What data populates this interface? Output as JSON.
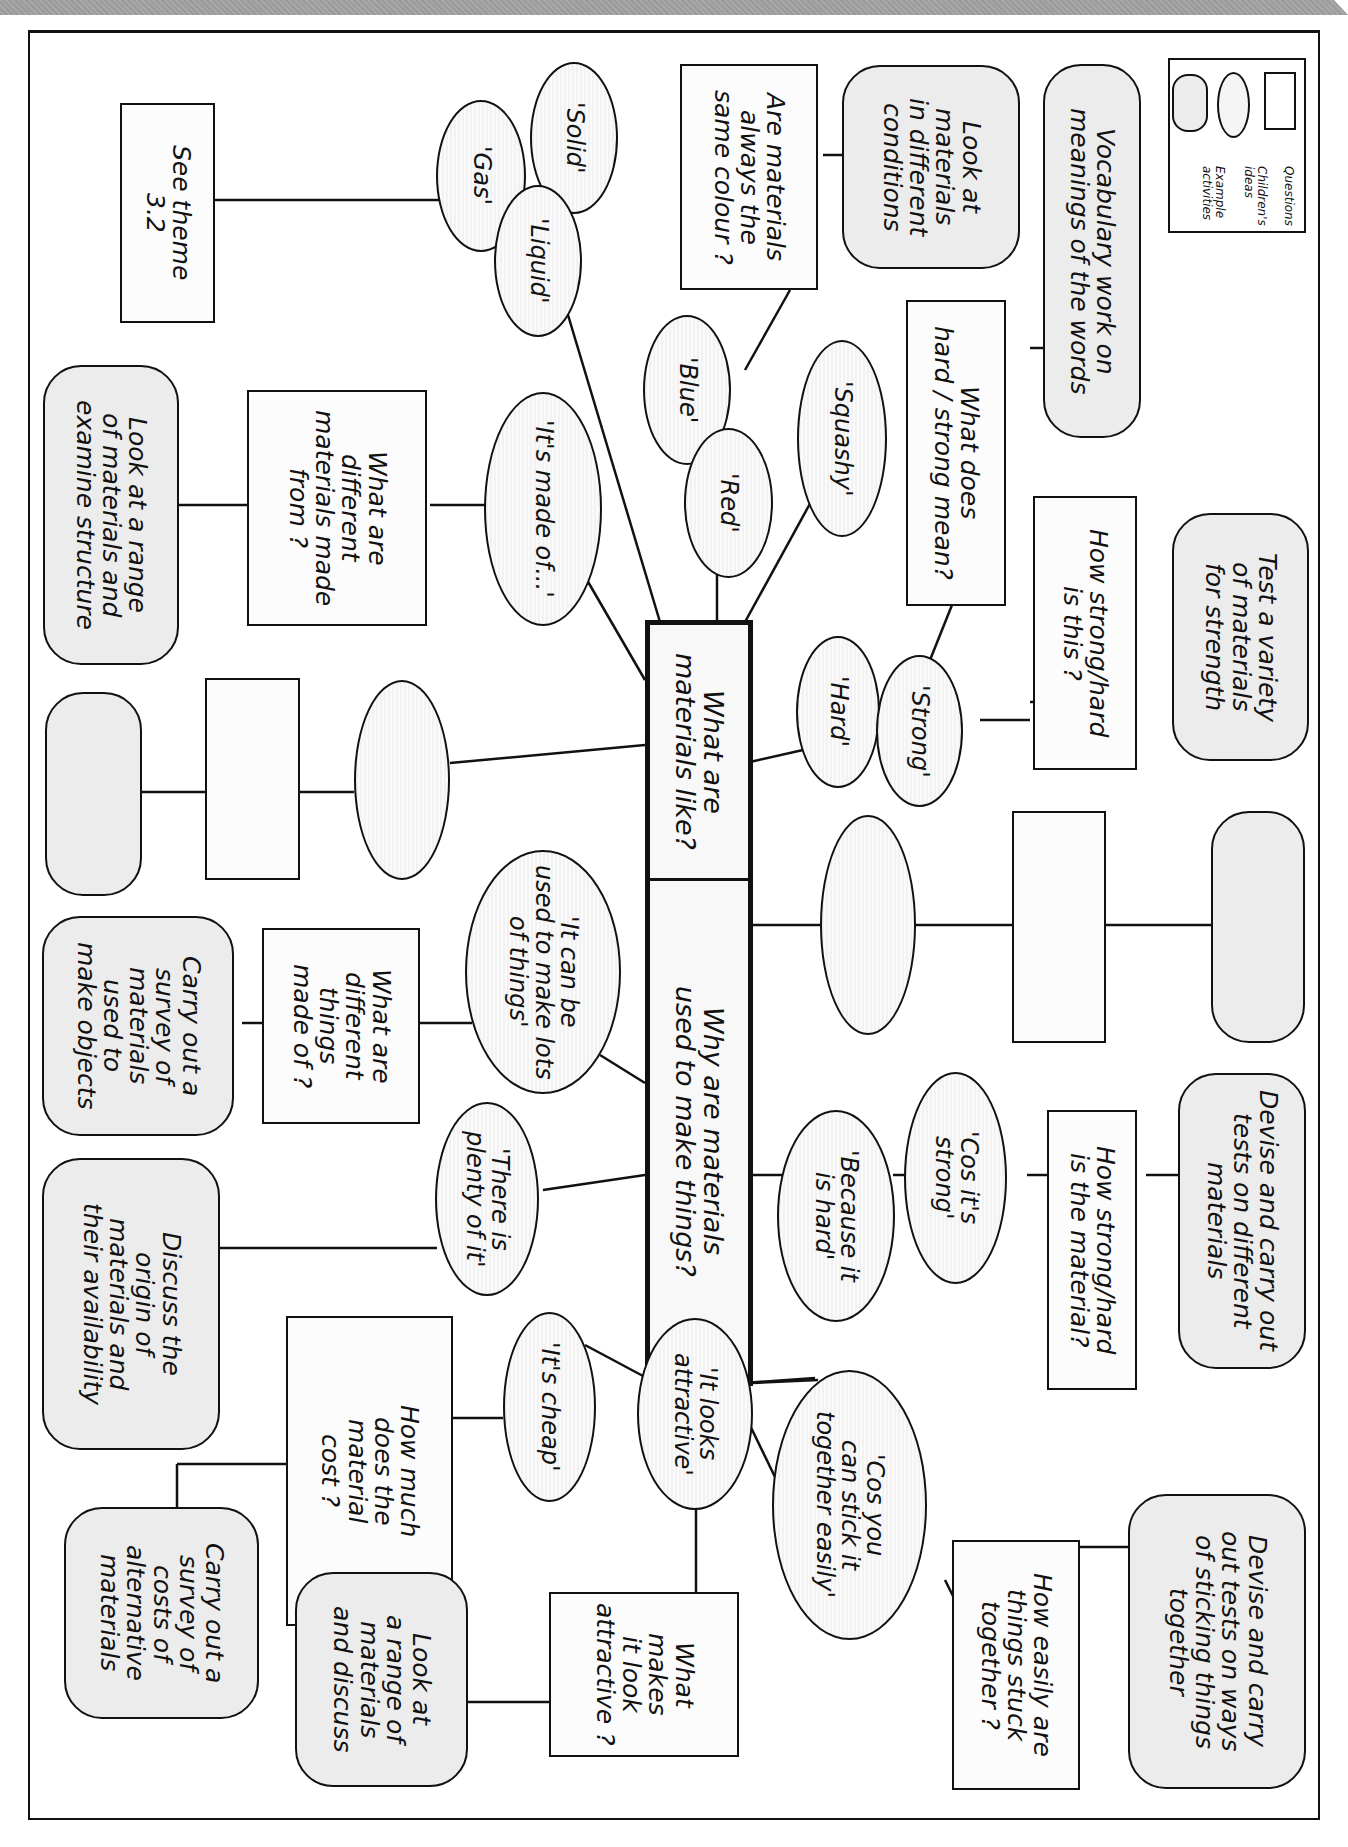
{
  "diagram": {
    "orientation": "rotated 90 degrees clockwise",
    "legend": {
      "items": [
        {
          "shape": "rectangle",
          "label": "Questions"
        },
        {
          "shape": "ellipse",
          "label": "Children's ideas"
        },
        {
          "shape": "rounded-rectangle",
          "label": "Example activities"
        }
      ]
    },
    "central": [
      {
        "id": "c1",
        "label": "What are\nmaterials like?"
      },
      {
        "id": "c2",
        "label": "Why are materials\nused to make things?"
      }
    ],
    "ideas": [
      {
        "id": "i_solid",
        "label": "'Solid'"
      },
      {
        "id": "i_gas",
        "label": "'Gas'"
      },
      {
        "id": "i_liquid",
        "label": "'Liquid'"
      },
      {
        "id": "i_blue",
        "label": "'Blue'"
      },
      {
        "id": "i_red",
        "label": "'Red'"
      },
      {
        "id": "i_squashy",
        "label": "'Squashy'"
      },
      {
        "id": "i_madeof",
        "label": "'It's made of...'"
      },
      {
        "id": "i_hard",
        "label": "'Hard'"
      },
      {
        "id": "i_strong",
        "label": "'Strong'"
      },
      {
        "id": "i_blank_left",
        "label": ""
      },
      {
        "id": "i_blank_right",
        "label": ""
      },
      {
        "id": "i_lots",
        "label": "'It can be\nused to make lots\nof things'"
      },
      {
        "id": "i_plenty",
        "label": "'There is\nplenty of it'"
      },
      {
        "id": "i_cheap",
        "label": "'It's cheap'"
      },
      {
        "id": "i_attractive",
        "label": "'It looks\nattractive'"
      },
      {
        "id": "i_stick",
        "label": "'Cos you\ncan stick it\ntogether easily'"
      },
      {
        "id": "i_becausehard",
        "label": "'Because it\nis hard'"
      },
      {
        "id": "i_cosstrong",
        "label": "'Cos it's\nstrong'"
      }
    ],
    "questions": [
      {
        "id": "q_theme",
        "label": "See theme\n3.2"
      },
      {
        "id": "q_colour",
        "label": "Are materials\nalways the\nsame colour ?"
      },
      {
        "id": "q_hardmean",
        "label": "What does\nhard / strong mean?"
      },
      {
        "id": "q_howstrong1",
        "label": "How strong/hard\nis this ?"
      },
      {
        "id": "q_madefrom",
        "label": "What are\ndifferent\nmaterials made\nfrom ?"
      },
      {
        "id": "q_blank_left",
        "label": ""
      },
      {
        "id": "q_blank_right",
        "label": ""
      },
      {
        "id": "q_thingsmade",
        "label": "What are\ndifferent\nthings\nmade of ?"
      },
      {
        "id": "q_cost",
        "label": "How much\ndoes the\nmaterial\ncost ?"
      },
      {
        "id": "q_makesattr",
        "label": "What\nmakes\nit look\nattractive ?"
      },
      {
        "id": "q_stuck",
        "label": "How easily are\nthings stuck\ntogether ?"
      },
      {
        "id": "q_howstrong2",
        "label": "How strong/hard\nis the material?"
      }
    ],
    "activities": [
      {
        "id": "a_vocab",
        "label": "Vocabulary work on\nmeanings of the words"
      },
      {
        "id": "a_conditions",
        "label": "Look at\nmaterials\nin different\nconditions"
      },
      {
        "id": "a_strength",
        "label": "Test a variety\nof materials\nfor strength"
      },
      {
        "id": "a_structure",
        "label": "Look at a range\nof materials and\nexamine structure"
      },
      {
        "id": "a_blank_left",
        "label": ""
      },
      {
        "id": "a_blank_right",
        "label": ""
      },
      {
        "id": "a_survey_objects",
        "label": "Carry out a\nsurvey of\nmaterials\nused to\nmake objects"
      },
      {
        "id": "a_origin",
        "label": "Discuss the\norigin of\nmaterials and\ntheir availability"
      },
      {
        "id": "a_costs",
        "label": "Carry out a\nsurvey of\ncosts of\nalternative\nmaterials"
      },
      {
        "id": "a_rangediscuss",
        "label": "Look at\na range of\nmaterials\nand discuss"
      },
      {
        "id": "a_sticking",
        "label": "Devise and carry\nout tests on ways\nof sticking things\ntogether"
      },
      {
        "id": "a_tests",
        "label": "Devise and carry out\ntests on different\nmaterials"
      }
    ],
    "colors": {
      "stroke": "#111111",
      "question_fill": "#fcfcfc",
      "idea_fill": "#f5f5f5",
      "activity_fill": "#ececec",
      "header_band": "#a0a0a0"
    }
  }
}
